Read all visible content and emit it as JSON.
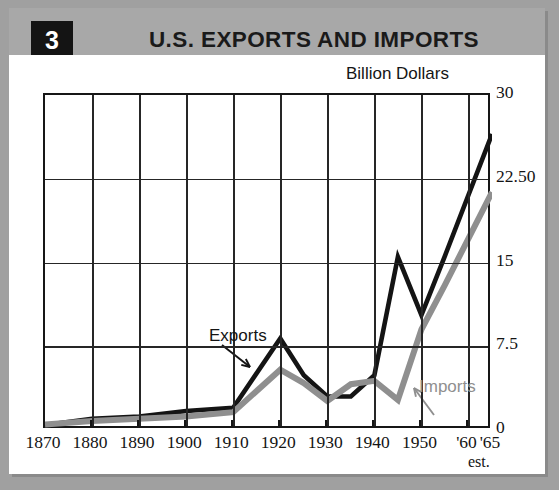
{
  "header": {
    "badge": "3",
    "title": "U.S. EXPORTS AND IMPORTS"
  },
  "axis": {
    "unit_label": "Billion Dollars",
    "y_ticks": [
      "0",
      "7.5",
      "15",
      "22.50",
      "30"
    ],
    "x_ticks": [
      "1870",
      "1880",
      "1890",
      "1900",
      "1910",
      "1920",
      "1930",
      "1940",
      "1950",
      "'60",
      "'65"
    ],
    "est_note": "est."
  },
  "series_labels": {
    "exports": "Exports",
    "imports": "Imports"
  },
  "colors": {
    "exports_line": "#141414",
    "imports_line": "#8f8f8f",
    "header_bg": "#a8a8a8",
    "badge_bg": "#141414",
    "frame_bg": "#a0a0a0",
    "grid": "#262626"
  },
  "chart_data": {
    "type": "line",
    "title": "U.S. EXPORTS AND IMPORTS",
    "xlabel": "",
    "ylabel": "Billion Dollars",
    "xlim": [
      1870,
      1965
    ],
    "ylim": [
      0,
      30
    ],
    "y_tick_values": [
      0,
      7.5,
      15,
      22.5,
      30
    ],
    "x_tick_values": [
      1870,
      1880,
      1890,
      1900,
      1910,
      1920,
      1930,
      1940,
      1950,
      1960,
      1965
    ],
    "grid": true,
    "legend": "inline-annotations",
    "series": [
      {
        "name": "Exports",
        "color": "#141414",
        "x": [
          1870,
          1880,
          1890,
          1900,
          1910,
          1920,
          1925,
          1930,
          1935,
          1940,
          1945,
          1950,
          1955,
          1965
        ],
        "values": [
          0.45,
          1.0,
          1.2,
          1.7,
          2.0,
          8.2,
          4.9,
          3.0,
          3.0,
          4.9,
          15.5,
          10.3,
          15.6,
          26.5
        ]
      },
      {
        "name": "Imports",
        "color": "#8f8f8f",
        "x": [
          1870,
          1880,
          1890,
          1900,
          1910,
          1920,
          1925,
          1930,
          1935,
          1940,
          1945,
          1950,
          1955,
          1965
        ],
        "values": [
          0.5,
          0.8,
          1.0,
          1.2,
          1.6,
          5.4,
          4.2,
          2.6,
          4.1,
          4.4,
          2.7,
          9.0,
          13.0,
          21.3
        ]
      }
    ]
  }
}
